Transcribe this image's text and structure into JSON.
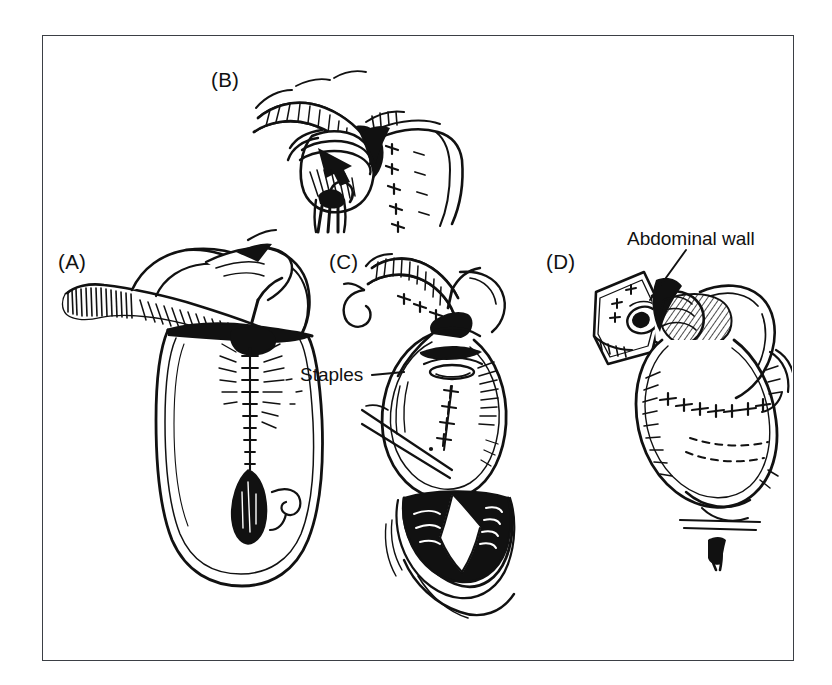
{
  "figure": {
    "kind": "medical-line-illustration",
    "ink_color": "#111111",
    "background_color": "#ffffff",
    "frame_color": "#3b3f45"
  },
  "panels": [
    {
      "id": "a",
      "label": "(A)",
      "description": "Ileal reservoir with efferent limb laid across the top; continuous suture line runs down the anterior face of the pouch to a dark open enterotomy."
    },
    {
      "id": "b",
      "label": "(B)",
      "description": "Close-up of the intussuscepted nipple valve; the efferent limb is invaginated and secured, with interrupted sutures along the pouch wall."
    },
    {
      "id": "c",
      "label": "(C)",
      "description": "Completed pouch seen from the front with the stapled nipple valve; the open distal bowel forms a dark V-shaped cavity below."
    },
    {
      "id": "d",
      "label": "(D)",
      "description": "Pouch fixed to the under-surface of the abdominal wall with the stoma brought out through a square fascial window."
    }
  ],
  "callouts": [
    {
      "id": "staples",
      "text": "Staples",
      "leader": "horizontal-right"
    },
    {
      "id": "abdominal_wall",
      "text": "Abdominal wall",
      "leader": "diagonal-down-left"
    }
  ]
}
